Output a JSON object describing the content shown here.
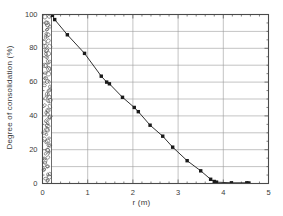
{
  "figure": {
    "background": "#ffffff",
    "frame_color": "#4a4a4a",
    "grid_color": "#9a9a9a",
    "series_color": "#1a1a1a"
  },
  "chart_data": {
    "type": "scatter",
    "title": "",
    "xlabel": "r (m)",
    "ylabel": "Degree of consolidation (%)",
    "xlim": [
      0,
      5
    ],
    "ylim": [
      0,
      100
    ],
    "xticks": [
      0,
      1,
      2,
      3,
      4,
      5
    ],
    "yticks": [
      0,
      20,
      40,
      60,
      80,
      100
    ],
    "xtick_labels": [
      "0",
      "1",
      "2",
      "3",
      "4",
      "5"
    ],
    "ytick_labels": [
      "0",
      "20",
      "40",
      "60",
      "80",
      "100"
    ],
    "x_minor_tick_step": 0.2,
    "y_minor_tick_step": 5,
    "grid": true,
    "grid_x_values": [
      1,
      2,
      3,
      4
    ],
    "grid_y_values": [
      10,
      20,
      30,
      40,
      50,
      60,
      70,
      80,
      90
    ],
    "legend": null,
    "marker": "filled-square",
    "line_style": "solid",
    "series": [
      {
        "name": "Degree of consolidation",
        "points": [
          [
            0.22,
            99.5
          ],
          [
            0.27,
            97.0
          ],
          [
            0.55,
            88.0
          ],
          [
            0.93,
            77.0
          ],
          [
            1.3,
            63.5
          ],
          [
            1.42,
            60.0
          ],
          [
            1.48,
            59.0
          ],
          [
            1.77,
            51.0
          ],
          [
            2.03,
            45.0
          ],
          [
            2.12,
            42.5
          ],
          [
            2.38,
            34.5
          ],
          [
            2.66,
            28.0
          ],
          [
            2.88,
            21.5
          ],
          [
            3.2,
            13.5
          ],
          [
            3.5,
            7.5
          ],
          [
            3.72,
            2.5
          ],
          [
            3.8,
            1.2
          ],
          [
            3.85,
            0.8
          ],
          [
            4.18,
            0.4
          ],
          [
            4.52,
            0.4
          ],
          [
            4.56,
            0.3
          ]
        ]
      }
    ],
    "annotations": [
      {
        "name": "stone-column",
        "type": "hatched-region",
        "pattern": "gravel",
        "x_range": [
          0.0,
          0.2
        ],
        "y_range": [
          0,
          100
        ],
        "description": "stone column"
      }
    ]
  },
  "axes": {
    "y_title": "Degree of consolidation (%)",
    "x_title": "r (m)"
  }
}
